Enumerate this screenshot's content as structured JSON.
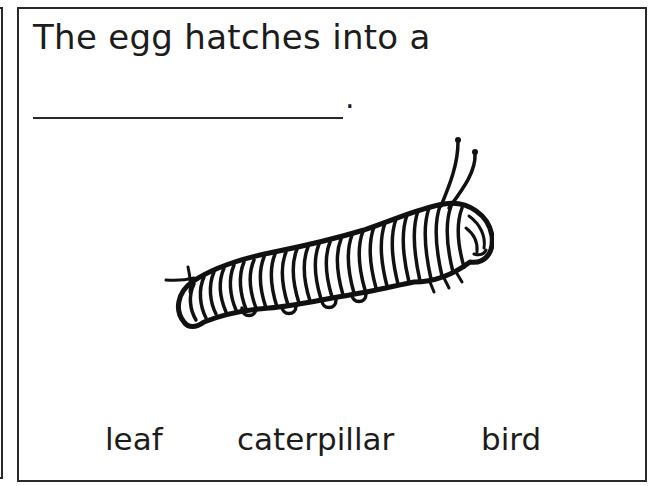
{
  "worksheet": {
    "prompt": "The egg hatches into a",
    "blank": {
      "answer": "",
      "terminator": "."
    },
    "illustration": {
      "subject": "caterpillar-drawing"
    },
    "choices": [
      {
        "label": "leaf"
      },
      {
        "label": "caterpillar"
      },
      {
        "label": "bird"
      }
    ]
  },
  "colors": {
    "ink": "#1c1c1c",
    "border": "#2a2a2a",
    "background": "#ffffff"
  }
}
